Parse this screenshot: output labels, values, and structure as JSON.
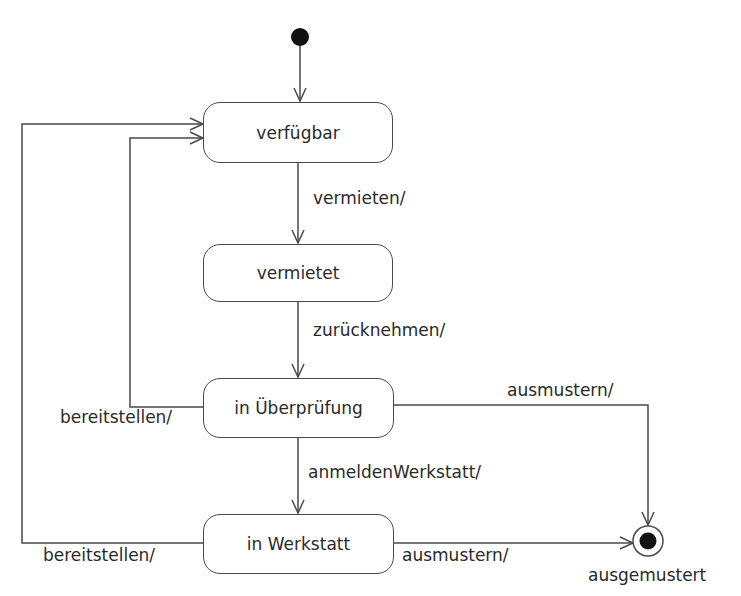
{
  "diagram": {
    "type": "UML state machine",
    "colors": {
      "line": "#4a4a4a",
      "text": "#2a2a2a",
      "background": "#ffffff"
    },
    "initial_state": {
      "icon": "filled-circle"
    },
    "final_state": {
      "icon": "bullseye-circle",
      "label": "ausgemustert"
    },
    "states": [
      {
        "id": "verfuegbar",
        "label": "verfügbar"
      },
      {
        "id": "vermietet",
        "label": "vermietet"
      },
      {
        "id": "in_ueberpruefung",
        "label": "in Überprüfung"
      },
      {
        "id": "in_werkstatt",
        "label": "in Werkstatt"
      }
    ],
    "transitions": [
      {
        "from": "initial",
        "to": "verfuegbar",
        "label": ""
      },
      {
        "from": "verfuegbar",
        "to": "vermietet",
        "label": "vermieten/"
      },
      {
        "from": "vermietet",
        "to": "in_ueberpruefung",
        "label": "zurücknehmen/"
      },
      {
        "from": "in_ueberpruefung",
        "to": "verfuegbar",
        "label": "bereitstellen/"
      },
      {
        "from": "in_ueberpruefung",
        "to": "in_werkstatt",
        "label": "anmeldenWerkstatt/"
      },
      {
        "from": "in_ueberpruefung",
        "to": "final",
        "label": "ausmustern/"
      },
      {
        "from": "in_werkstatt",
        "to": "verfuegbar",
        "label": "bereitstellen/"
      },
      {
        "from": "in_werkstatt",
        "to": "final",
        "label": "ausmustern/"
      }
    ]
  }
}
